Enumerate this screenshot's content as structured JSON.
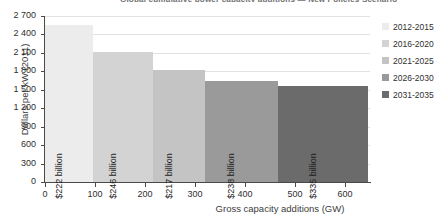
{
  "chart_data": {
    "type": "bar",
    "title": "Global cumulative power capacity additions — New Policies Scenario",
    "xlabel": "Gross capacity additions (GW)",
    "ylabel": "Dollars per kW (2011)",
    "xlim": [
      0,
      650
    ],
    "ylim": [
      0,
      2700
    ],
    "grid": true,
    "legend_position": "right",
    "variable_width": true,
    "xticks": [
      0,
      100,
      200,
      300,
      400,
      500,
      600
    ],
    "yticks": [
      0,
      300,
      600,
      900,
      1200,
      1500,
      1800,
      2100,
      2400,
      2700
    ],
    "categories": [
      "2012-2015",
      "2016-2020",
      "2021-2025",
      "2026-2030",
      "2031-2035"
    ],
    "values": [
      2550,
      2110,
      1830,
      1650,
      1560
    ],
    "widths": [
      95,
      120,
      105,
      145,
      180
    ],
    "x_start": [
      0,
      95,
      215,
      320,
      465
    ],
    "x_end": [
      95,
      215,
      320,
      465,
      645
    ],
    "bar_labels": [
      "$222 billion",
      "$246 billion",
      "$217 billion",
      "$238 billion",
      "$335 billion"
    ],
    "colors": [
      "#ececec",
      "#d3d3d3",
      "#c4c4c4",
      "#9a9a9a",
      "#6b6b6b"
    ],
    "series": [
      {
        "name": "2012-2015",
        "cost_per_kw": 2550,
        "capacity_gw": 95,
        "investment": "$222 billion",
        "color": "#ececec"
      },
      {
        "name": "2016-2020",
        "cost_per_kw": 2110,
        "capacity_gw": 120,
        "investment": "$246 billion",
        "color": "#d3d3d3"
      },
      {
        "name": "2021-2025",
        "cost_per_kw": 1830,
        "capacity_gw": 105,
        "investment": "$217 billion",
        "color": "#c4c4c4"
      },
      {
        "name": "2026-2030",
        "cost_per_kw": 1650,
        "capacity_gw": 145,
        "investment": "$238 billion",
        "color": "#9a9a9a"
      },
      {
        "name": "2031-2035",
        "cost_per_kw": 1560,
        "capacity_gw": 180,
        "investment": "$335 billion",
        "color": "#6b6b6b"
      }
    ]
  },
  "axes": {
    "y_tick_labels": [
      "0",
      "300",
      "600",
      "900",
      "1 200",
      "1 500",
      "1 800",
      "2 100",
      "2 400",
      "2 700"
    ],
    "x_tick_labels": [
      "0",
      "100",
      "200",
      "300",
      "400",
      "500",
      "600"
    ]
  },
  "legend": {
    "items": [
      {
        "label": "2012-2015",
        "color": "#ececec"
      },
      {
        "label": "2016-2020",
        "color": "#d3d3d3"
      },
      {
        "label": "2021-2025",
        "color": "#c4c4c4"
      },
      {
        "label": "2026-2030",
        "color": "#9a9a9a"
      },
      {
        "label": "2031-2035",
        "color": "#6b6b6b"
      }
    ]
  }
}
